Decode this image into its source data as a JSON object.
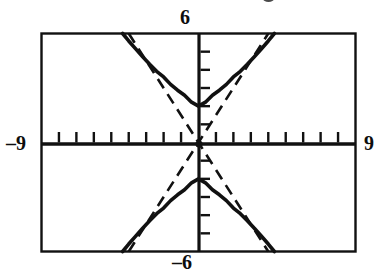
{
  "figure": {
    "title": "",
    "kind": "graphing-calculator-window",
    "background_color": "#ffffff",
    "ink_color": "#111111"
  },
  "labels": {
    "y_max": "6",
    "y_min": "–6",
    "x_min": "–9",
    "x_max": "9"
  },
  "chart_data": {
    "type": "line",
    "title": "",
    "xlabel": "",
    "ylabel": "",
    "xlim": [
      -9,
      9
    ],
    "ylim": [
      -6,
      6
    ],
    "grid": false,
    "legend": false,
    "x_tick_step": 1,
    "y_tick_step": 1,
    "x_ticks": [
      -8,
      -7,
      -6,
      -5,
      -4,
      -3,
      -2,
      -1,
      1,
      2,
      3,
      4,
      5,
      6,
      7,
      8
    ],
    "y_ticks": [
      -5,
      -4,
      -3,
      -2,
      -1,
      1,
      2,
      3,
      4,
      5
    ],
    "equation": "y^2/4 - x^2/(16/9) = 1",
    "vertices": [
      [
        0,
        2
      ],
      [
        0,
        -2
      ]
    ],
    "asymptote_slopes": [
      1.5,
      -1.5
    ],
    "series": [
      {
        "name": "hyperbola-upper-branch",
        "style": "solid",
        "linewidth": 3.2,
        "points": [
          [
            -4.35,
            6.0
          ],
          [
            -4.0,
            5.59
          ],
          [
            -3.6,
            5.15
          ],
          [
            -3.2,
            4.72
          ],
          [
            -2.8,
            4.31
          ],
          [
            -2.4,
            3.92
          ],
          [
            -2.0,
            3.61
          ],
          [
            -1.6,
            3.2
          ],
          [
            -1.2,
            2.88
          ],
          [
            -0.8,
            2.6
          ],
          [
            -0.4,
            2.22
          ],
          [
            0.0,
            2.0
          ],
          [
            0.4,
            2.22
          ],
          [
            0.8,
            2.6
          ],
          [
            1.2,
            2.88
          ],
          [
            1.6,
            3.2
          ],
          [
            2.0,
            3.61
          ],
          [
            2.4,
            3.92
          ],
          [
            2.8,
            4.31
          ],
          [
            3.2,
            4.72
          ],
          [
            3.6,
            5.15
          ],
          [
            4.0,
            5.59
          ],
          [
            4.35,
            6.0
          ]
        ]
      },
      {
        "name": "hyperbola-lower-branch",
        "style": "solid",
        "linewidth": 3.2,
        "points": [
          [
            -4.35,
            -6.0
          ],
          [
            -4.0,
            -5.59
          ],
          [
            -3.6,
            -5.15
          ],
          [
            -3.2,
            -4.72
          ],
          [
            -2.8,
            -4.31
          ],
          [
            -2.4,
            -3.92
          ],
          [
            -2.0,
            -3.61
          ],
          [
            -1.6,
            -3.2
          ],
          [
            -1.2,
            -2.88
          ],
          [
            -0.8,
            -2.6
          ],
          [
            -0.4,
            -2.22
          ],
          [
            0.0,
            -2.0
          ],
          [
            0.4,
            -2.22
          ],
          [
            0.8,
            -2.6
          ],
          [
            1.2,
            -2.88
          ],
          [
            1.6,
            -3.2
          ],
          [
            2.0,
            -3.61
          ],
          [
            2.4,
            -3.92
          ],
          [
            2.8,
            -4.31
          ],
          [
            3.2,
            -4.72
          ],
          [
            3.6,
            -5.15
          ],
          [
            4.0,
            -5.59
          ],
          [
            4.35,
            -6.0
          ]
        ]
      },
      {
        "name": "asymptote-positive-slope",
        "style": "dashed",
        "linewidth": 2.4,
        "points": [
          [
            -4.0,
            -6.0
          ],
          [
            4.0,
            6.0
          ]
        ]
      },
      {
        "name": "asymptote-negative-slope",
        "style": "dashed",
        "linewidth": 2.4,
        "points": [
          [
            -4.0,
            6.0
          ],
          [
            4.0,
            -6.0
          ]
        ]
      }
    ]
  }
}
